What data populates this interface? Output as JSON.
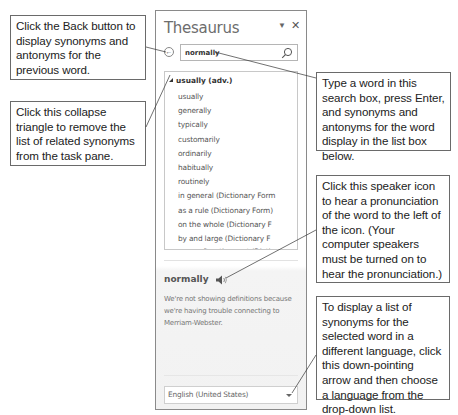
{
  "pane": {
    "title": "Thesaurus",
    "menu_icon": "dropdown-triangle-icon",
    "close_icon": "close-icon",
    "back_icon": "back-arrow-icon",
    "search": {
      "value": "normally",
      "icon": "search-icon"
    },
    "list": {
      "heading": "usually (adv.)",
      "collapse_icon": "collapse-triangle-icon",
      "items": [
        "usually",
        "generally",
        "typically",
        "customarily",
        "ordinarily",
        "habitually",
        "routinely",
        "in general (Dictionary Form",
        "as a rule (Dictionary Form)",
        "on the whole (Dictionary F",
        "by and large (Dictionary F",
        "more often than not (Dictio"
      ]
    },
    "definition": {
      "word": "normally",
      "speaker_icon": "speaker-icon",
      "message": "We're not showing definitions because we're having trouble connecting to Merriam-Webster."
    },
    "language": {
      "selected": "English (United States)",
      "arrow_icon": "chevron-down-icon"
    }
  },
  "callouts": {
    "back": "Click the Back button to display synonyms and antonyms for the previous word.",
    "collapse": "Click this collapse triangle to remove the list of related synonyms from the task pane.",
    "search": "Type a word in this search box, press Enter, and synonyms and antonyms for the word display in the list box below.",
    "speaker": "Click this speaker icon to hear a pronunciation of the word to the left of the icon. (Your computer speakers must be turned on to hear the pronunciation.)",
    "language": "To display a list of synonyms for the selected word in a different language, click this down-pointing arrow and then choose a language from the drop-down list."
  },
  "colors": {
    "callout_border": "#6a6a6a",
    "pane_border": "#8a8a8a",
    "title_text": "#6d6d6d"
  }
}
